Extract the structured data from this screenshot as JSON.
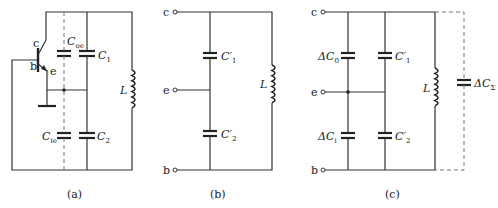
{
  "figure": {
    "panels": [
      {
        "id": "a",
        "caption": "(a)",
        "transistor_terminals": {
          "collector": "c",
          "base": "b",
          "emitter": "e"
        },
        "components": {
          "c_oe": {
            "symbol": "C",
            "subscript": "oe"
          },
          "c1": {
            "symbol": "C",
            "subscript": "1"
          },
          "c_ie": {
            "symbol": "C",
            "subscript": "ie"
          },
          "c2": {
            "symbol": "C",
            "subscript": "2"
          },
          "inductor": "L"
        }
      },
      {
        "id": "b",
        "caption": "(b)",
        "terminals": {
          "top": "c",
          "middle": "e",
          "bottom": "b"
        },
        "components": {
          "c1p": {
            "symbol": "C′",
            "subscript": "1"
          },
          "c2p": {
            "symbol": "C′",
            "subscript": "2"
          },
          "inductor": "L"
        }
      },
      {
        "id": "c",
        "caption": "(c)",
        "terminals": {
          "top": "c",
          "middle": "e",
          "bottom": "b"
        },
        "components": {
          "dc0": {
            "symbol": "ΔC",
            "subscript": "0"
          },
          "dc1": {
            "symbol": "ΔC",
            "subscript": "i"
          },
          "c1p": {
            "symbol": "C′",
            "subscript": "1"
          },
          "c2p": {
            "symbol": "C′",
            "subscript": "2"
          },
          "inductor": "L",
          "dcsum": {
            "symbol": "ΔC",
            "subscript": "Σ"
          }
        }
      }
    ]
  }
}
